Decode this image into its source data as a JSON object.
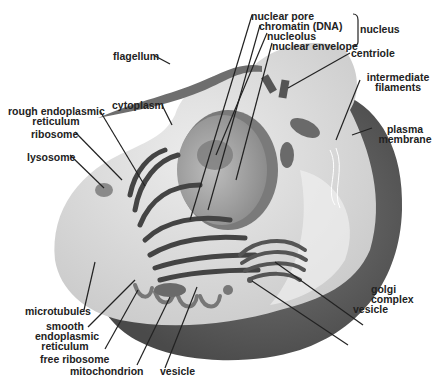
{
  "diagram": {
    "colors": {
      "background": "#ffffff",
      "cytoplasm": "#d9d9d9",
      "membrane_outer": "#5e5e5e",
      "nucleus": "#a8a8a8",
      "organelle": "#6a6a6a",
      "label_text": "#222222",
      "leader_line": "#222222"
    },
    "labels": {
      "nuclear_pore": "nuclear pore",
      "chromatin": "chromatin (DNA)",
      "nucleolus": "nucleolus",
      "nuclear_envelope": "nuclear envelope",
      "nucleus_group": "nucleus",
      "centriole": "centriole",
      "intermediate_filaments_1": "intermediate",
      "intermediate_filaments_2": "filaments",
      "plasma_membrane_1": "plasma",
      "plasma_membrane_2": "membrane",
      "flagellum": "flagellum",
      "cytoplasm": "cytoplasm",
      "rough_er_1": "rough endoplasmic",
      "rough_er_2": "reticulum",
      "ribosome": "ribosome",
      "lysosome": "lysosome",
      "microtubules": "microtubules",
      "smooth_er_1": "smooth",
      "smooth_er_2": "endoplasmic",
      "smooth_er_3": "reticulum",
      "free_ribosome": "free ribosome",
      "mitochondrion": "mitochondrion",
      "vesicle_bottom": "vesicle",
      "golgi_1": "golgi",
      "golgi_2": "complex",
      "vesicle_right": "vesicle"
    }
  }
}
